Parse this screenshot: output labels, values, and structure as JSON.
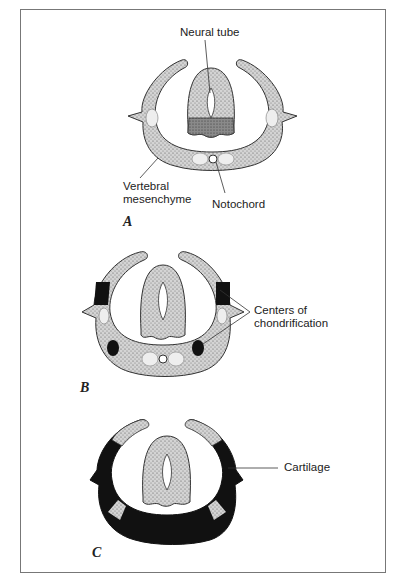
{
  "figure": {
    "panels": [
      {
        "id": "A",
        "label": "A"
      },
      {
        "id": "B",
        "label": "B"
      },
      {
        "id": "C",
        "label": "C"
      }
    ],
    "labels": {
      "neural_tube": "Neural tube",
      "vertebral_mesenchyme_line1": "Vertebral",
      "vertebral_mesenchyme_line2": "mesenchyme",
      "notochord": "Notochord",
      "centers_line1": "Centers of",
      "centers_line2": "chondrification",
      "cartilage": "Cartilage"
    },
    "colors": {
      "stipple": "#c9c9c9",
      "dark_stipple": "#8a8a8a",
      "cartilage": "#111111",
      "outline": "#333333",
      "border": "#777777"
    }
  }
}
